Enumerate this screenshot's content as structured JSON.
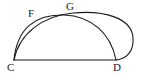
{
  "figure": {
    "background_color": "#ffffff",
    "stroke_color": "#1a1a1a",
    "labels": {
      "F": "F",
      "G": "G",
      "C": "C",
      "D": "D"
    },
    "points": {
      "C": {
        "x": 14,
        "y": 60
      },
      "D": {
        "x": 116,
        "y": 60
      },
      "G": {
        "x": 70,
        "y": 13
      },
      "F": {
        "x": 32,
        "y": 14
      }
    },
    "shapes": [
      {
        "name": "baseline-segment-CD",
        "type": "line",
        "from": "C",
        "to": "D"
      },
      {
        "name": "inner-arc-CGD",
        "type": "arc",
        "from": "C",
        "to": "D",
        "apex": {
          "x": 65,
          "y": 16
        }
      },
      {
        "name": "outer-arc-CFGD",
        "type": "arc",
        "from": "C",
        "to": "D",
        "apex": {
          "x": 100,
          "y": 11
        },
        "right_extent": {
          "x": 133,
          "y": 40
        }
      }
    ]
  }
}
